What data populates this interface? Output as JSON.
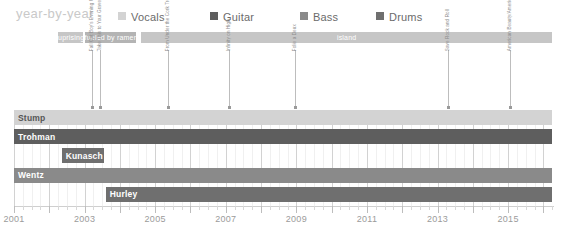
{
  "header": {
    "title": "year-by-year",
    "legend": [
      {
        "label": "Vocals",
        "color": "#d3d3d3",
        "x": 0
      },
      {
        "label": "Guitar",
        "color": "#5e5e5e",
        "x": 92
      },
      {
        "label": "Bass",
        "color": "#8a8a8a",
        "x": 182
      },
      {
        "label": "Drums",
        "color": "#6f6f6f",
        "x": 258
      }
    ]
  },
  "chart_data": {
    "type": "timeline",
    "title": "year-by-year",
    "xlabel": "",
    "ylabel": "",
    "xlim": [
      2001,
      2016.3
    ],
    "grid": true,
    "legend_position": "top",
    "tick_years": [
      "2001",
      "2003",
      "2005",
      "2007",
      "2009",
      "2011",
      "2013",
      "2015"
    ],
    "tick_values": [
      2001,
      2003,
      2005,
      2007,
      2009,
      2011,
      2013,
      2015
    ],
    "roles": {
      "vocals": "#d3d3d3",
      "guitar": "#5e5e5e",
      "bass": "#8a8a8a",
      "drums": "#6f6f6f"
    },
    "record_labels": [
      {
        "name": "uprising",
        "start": 2002.25,
        "end": 2002.95,
        "color": "#c6c6c6"
      },
      {
        "name": "fueled by ramen",
        "start": 2003.0,
        "end": 2004.45,
        "color": "#b4b4b4"
      },
      {
        "name": "island",
        "start": 2004.6,
        "end": 2016.25,
        "color": "#c6c6c6"
      }
    ],
    "albums": [
      {
        "title": "Fall Out Boy's Evening Out with Your Girlfriend",
        "year": 2003.2
      },
      {
        "title": "Take This to Your Grave",
        "year": 2003.45
      },
      {
        "title": "From Under the Cork Tree",
        "year": 2005.35
      },
      {
        "title": "Infinity on High",
        "year": 2007.1
      },
      {
        "title": "Folie a Deux",
        "year": 2008.95
      },
      {
        "title": "Save Rock and Roll",
        "year": 2013.3
      },
      {
        "title": "American Beauty/American Psycho",
        "year": 2015.05
      }
    ],
    "members": [
      {
        "name": "Stump",
        "role": "vocals",
        "color": "#d3d3d3",
        "label_inside": true,
        "segments": [
          {
            "start": 2001.0,
            "end": 2009.55,
            "state": "active"
          },
          {
            "start": 2009.55,
            "end": 2012.85,
            "state": "hiatus"
          },
          {
            "start": 2012.85,
            "end": 2016.25,
            "state": "active"
          }
        ]
      },
      {
        "name": "Trohman",
        "role": "guitar",
        "color": "#5e5e5e",
        "label_inside": true,
        "segments": [
          {
            "start": 2001.0,
            "end": 2009.55,
            "state": "active"
          },
          {
            "start": 2009.55,
            "end": 2012.85,
            "state": "hiatus"
          },
          {
            "start": 2012.85,
            "end": 2016.25,
            "state": "active"
          }
        ]
      },
      {
        "name": "Kunasch",
        "role": "guitar",
        "color": "#6f6f6f",
        "label_inside": true,
        "segments": [
          {
            "start": 2002.35,
            "end": 2003.55,
            "state": "active"
          }
        ]
      },
      {
        "name": "Wentz",
        "role": "bass",
        "color": "#8a8a8a",
        "label_inside": true,
        "segments": [
          {
            "start": 2001.0,
            "end": 2009.55,
            "state": "active"
          },
          {
            "start": 2009.55,
            "end": 2012.85,
            "state": "hiatus"
          },
          {
            "start": 2012.85,
            "end": 2016.25,
            "state": "active"
          }
        ]
      },
      {
        "name": "Hurley",
        "role": "drums",
        "color": "#6f6f6f",
        "label_inside": true,
        "segments": [
          {
            "start": 2003.6,
            "end": 2009.55,
            "state": "active"
          },
          {
            "start": 2009.55,
            "end": 2012.85,
            "state": "hiatus"
          },
          {
            "start": 2012.85,
            "end": 2016.25,
            "state": "active"
          }
        ]
      }
    ]
  }
}
